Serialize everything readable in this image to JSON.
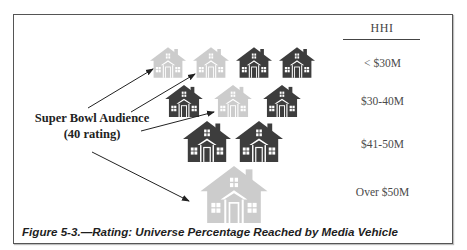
{
  "figure": {
    "caption": "Figure 5-3.—Rating: Universe Percentage Reached by Media Vehicle"
  },
  "source_label": {
    "line1": "Super Bowl Audience",
    "line2": "(40 rating)"
  },
  "hhi_column": {
    "header": "HHI",
    "brackets": [
      {
        "label": "< $30M"
      },
      {
        "label": "$30-40M"
      },
      {
        "label": "$41-50M"
      },
      {
        "label": "Over $50M"
      }
    ]
  },
  "colors": {
    "reached_house": "#3d3d3d",
    "not_reached_house": "#cccccc",
    "frame_border": "#555555",
    "arrow": "#222222"
  },
  "house_rows": [
    {
      "bracket": "< $30M",
      "houses": [
        "not_reached",
        "not_reached",
        "reached",
        "reached"
      ]
    },
    {
      "bracket": "$30-40M",
      "houses": [
        "reached",
        "not_reached",
        "reached"
      ]
    },
    {
      "bracket": "$41-50M",
      "houses": [
        "reached",
        "reached"
      ]
    },
    {
      "bracket": "Over $50M",
      "houses": [
        "not_reached"
      ]
    }
  ]
}
